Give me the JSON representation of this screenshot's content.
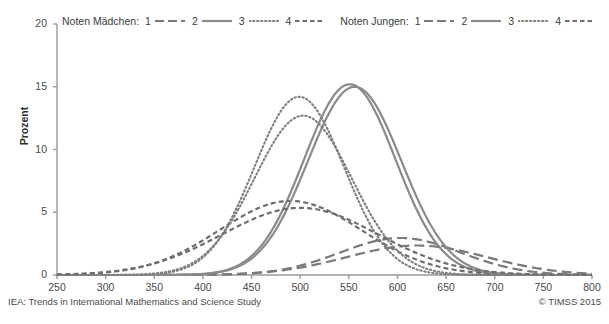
{
  "chart_data": {
    "type": "line",
    "title": "",
    "xlabel": "",
    "ylabel": "Prozent",
    "xlim": [
      250,
      800
    ],
    "ylim": [
      0,
      20
    ],
    "xticks": [
      250,
      300,
      350,
      400,
      450,
      500,
      550,
      600,
      650,
      700,
      750,
      800
    ],
    "yticks": [
      0,
      5,
      10,
      15,
      20
    ],
    "grid": false,
    "legend_position": "top",
    "legend_groups": [
      {
        "title": "Noten Mädchen:",
        "entries": [
          {
            "label": "1",
            "style": "long-dash"
          },
          {
            "label": "2",
            "style": "solid"
          },
          {
            "label": "3",
            "style": "dotted"
          },
          {
            "label": "4",
            "style": "short-dash"
          }
        ]
      },
      {
        "title": "Noten Jungen:",
        "entries": [
          {
            "label": "1",
            "style": "long-dash"
          },
          {
            "label": "2",
            "style": "solid"
          },
          {
            "label": "3",
            "style": "dotted"
          },
          {
            "label": "4",
            "style": "short-dash"
          }
        ]
      }
    ],
    "series": [
      {
        "name": "Noten Mädchen: 1",
        "style": "long-dash",
        "color": "#7a7a7a",
        "peak_x": 603,
        "peak_y": 2.95,
        "sigma": 62,
        "x": [
          250,
          300,
          350,
          400,
          450,
          500,
          520,
          550,
          580,
          600,
          620,
          650,
          680,
          700,
          730,
          760,
          800
        ],
        "values": [
          0.0,
          0.0,
          0.03,
          0.15,
          0.5,
          1.35,
          1.85,
          2.5,
          2.9,
          2.95,
          2.85,
          2.3,
          1.45,
          0.95,
          0.35,
          0.1,
          0.02
        ]
      },
      {
        "name": "Noten Mädchen: 2",
        "style": "solid",
        "color": "#8a8a8a",
        "peak_x": 551,
        "peak_y": 15.2,
        "sigma": 47,
        "x": [
          250,
          300,
          350,
          400,
          430,
          460,
          490,
          510,
          530,
          551,
          570,
          590,
          610,
          640,
          670,
          700,
          750,
          800
        ],
        "values": [
          0.0,
          0.02,
          0.12,
          1.0,
          2.6,
          5.6,
          10.0,
          12.6,
          14.5,
          15.2,
          14.4,
          12.2,
          9.0,
          4.4,
          1.7,
          0.5,
          0.05,
          0.0
        ]
      },
      {
        "name": "Noten Mädchen: 3",
        "style": "dotted",
        "color": "#7f7f7f",
        "peak_x": 499,
        "peak_y": 14.2,
        "sigma": 46,
        "x": [
          250,
          300,
          350,
          390,
          420,
          450,
          470,
          499,
          520,
          550,
          580,
          610,
          640,
          670,
          700,
          750,
          800
        ],
        "values": [
          0.0,
          0.05,
          0.45,
          1.8,
          3.9,
          8.2,
          11.3,
          14.2,
          13.3,
          10.0,
          5.9,
          2.7,
          1.0,
          0.3,
          0.08,
          0.0,
          0.0
        ]
      },
      {
        "name": "Noten Mädchen: 4",
        "style": "short-dash",
        "color": "#6f6f6f",
        "peak_x": 490,
        "peak_y": 5.9,
        "sigma": 73,
        "x": [
          250,
          300,
          330,
          360,
          390,
          420,
          450,
          470,
          490,
          520,
          550,
          580,
          610,
          640,
          670,
          700,
          750,
          800
        ],
        "values": [
          0.02,
          0.35,
          0.9,
          1.8,
          3.0,
          4.3,
          5.35,
          5.7,
          5.9,
          5.5,
          4.5,
          3.2,
          2.0,
          1.1,
          0.55,
          0.25,
          0.04,
          0.0
        ]
      },
      {
        "name": "Noten Jungen: 1",
        "style": "long-dash",
        "color": "#7a7a7a",
        "peak_x": 620,
        "peak_y": 2.35,
        "sigma": 72,
        "x": [
          250,
          300,
          350,
          400,
          450,
          500,
          530,
          560,
          590,
          620,
          650,
          680,
          700,
          730,
          760,
          800
        ],
        "values": [
          0.0,
          0.0,
          0.02,
          0.1,
          0.35,
          1.0,
          1.4,
          1.85,
          2.2,
          2.35,
          2.2,
          1.7,
          1.3,
          0.65,
          0.25,
          0.05
        ]
      },
      {
        "name": "Noten Jungen: 2",
        "style": "solid",
        "color": "#8a8a8a",
        "peak_x": 556,
        "peak_y": 15.0,
        "sigma": 48,
        "x": [
          250,
          300,
          350,
          400,
          430,
          460,
          490,
          510,
          530,
          556,
          575,
          595,
          615,
          645,
          675,
          700,
          750,
          800
        ],
        "values": [
          0.0,
          0.02,
          0.1,
          0.8,
          2.2,
          4.9,
          9.0,
          11.6,
          13.8,
          15.0,
          14.3,
          12.2,
          9.2,
          4.7,
          1.9,
          0.8,
          0.06,
          0.0
        ]
      },
      {
        "name": "Noten Jungen: 3",
        "style": "dotted",
        "color": "#7f7f7f",
        "peak_x": 503,
        "peak_y": 12.7,
        "sigma": 50,
        "x": [
          250,
          300,
          350,
          390,
          420,
          450,
          470,
          503,
          520,
          550,
          580,
          610,
          640,
          670,
          700,
          750,
          800
        ],
        "values": [
          0.0,
          0.06,
          0.5,
          1.9,
          3.7,
          7.3,
          9.9,
          12.7,
          12.3,
          9.7,
          6.2,
          3.1,
          1.3,
          0.4,
          0.1,
          0.0,
          0.0
        ]
      },
      {
        "name": "Noten Jungen: 4",
        "style": "short-dash",
        "color": "#6f6f6f",
        "peak_x": 500,
        "peak_y": 5.35,
        "sigma": 80,
        "x": [
          250,
          300,
          330,
          360,
          390,
          420,
          450,
          470,
          500,
          530,
          560,
          590,
          620,
          650,
          680,
          700,
          750,
          800
        ],
        "values": [
          0.03,
          0.4,
          0.95,
          1.8,
          2.9,
          4.0,
          4.9,
          5.2,
          5.35,
          5.05,
          4.3,
          3.3,
          2.3,
          1.4,
          0.75,
          0.45,
          0.07,
          0.0
        ]
      }
    ]
  },
  "footer": {
    "left": "IEA: Trends in International Mathematics and Science Study",
    "right": "© TIMSS 2015"
  },
  "axis": {
    "ylabel": "Prozent",
    "ytick_labels": [
      "0",
      "5",
      "10",
      "15",
      "20"
    ],
    "xtick_labels": [
      "250",
      "300",
      "350",
      "400",
      "450",
      "500",
      "550",
      "600",
      "650",
      "700",
      "750",
      "800"
    ]
  },
  "colors": {
    "axis": "#9a9a9a",
    "text": "#3b3b3b",
    "line": "#7d7d7d"
  }
}
